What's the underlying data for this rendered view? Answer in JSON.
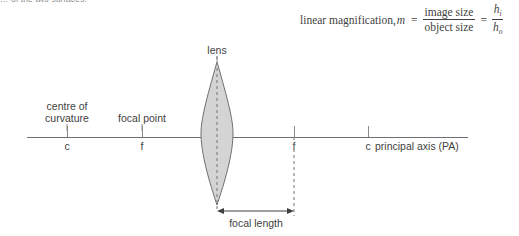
{
  "page": {
    "background_color": "#ffffff",
    "ink_color": "#3f3f41",
    "line_color": "#6f6f73",
    "lens_fill_color": "#d4d4d4",
    "lens_stroke_color": "#6f6f73"
  },
  "clipped_note": {
    "text": "… of the two surfaces."
  },
  "formula": {
    "lead_text": "linear magnification,",
    "variable": "m",
    "equals_1": "=",
    "numerator_1": "image size",
    "denominator_1": "object size",
    "equals_2": "=",
    "numerator_2": "h",
    "numerator_2_sub": "i",
    "denominator_2": "h",
    "denominator_2_sub": "o"
  },
  "diagram": {
    "lens_label": "lens",
    "focal_length_label": "focal length",
    "principal_axis_label": "principal axis (PA)",
    "descriptions": [
      {
        "id": "centre-of-curvature",
        "line1": "centre of",
        "line2": "curvature",
        "x": 67,
        "y": 100
      },
      {
        "id": "focal-point",
        "line1": "focal point",
        "line2": "",
        "x": 142,
        "y": 112
      }
    ],
    "points": [
      {
        "id": "left-centre-of-curvature",
        "label": "c",
        "x": 67
      },
      {
        "id": "left-focal-point",
        "label": "f",
        "x": 142
      },
      {
        "id": "right-focal-point",
        "label": "f",
        "x": 294
      },
      {
        "id": "right-centre-of-curvature",
        "label": "c",
        "x": 368
      }
    ],
    "axis": {
      "x_start": 27,
      "x_end": 468,
      "y": 137
    },
    "lens": {
      "center_x": 217,
      "top_y": 62,
      "bottom_y": 205,
      "half_width": 16
    },
    "focal_length_arrow": {
      "x_start": 217,
      "x_end": 294,
      "y": 211
    }
  }
}
